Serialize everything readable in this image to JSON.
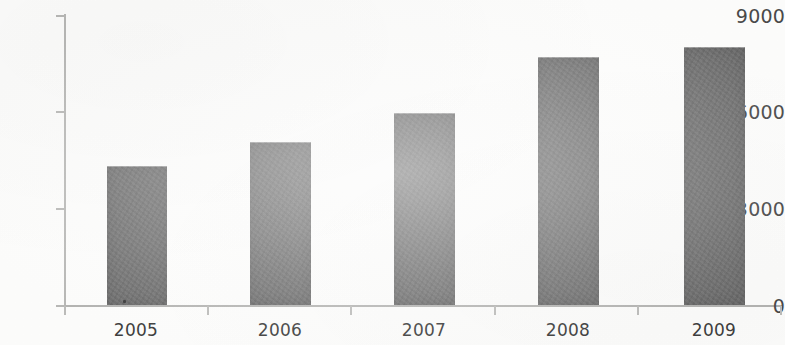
{
  "chart_data": {
    "type": "bar",
    "title": "",
    "subtitle": "",
    "xlabel": "",
    "ylabel": "",
    "categories": [
      "2005",
      "2006",
      "2007",
      "2008",
      "2009"
    ],
    "values": [
      4300,
      5050,
      5950,
      7700,
      8000
    ],
    "series": [
      {
        "name": "",
        "values": [
          4300,
          5050,
          5950,
          7700,
          8000
        ]
      }
    ],
    "ylim": [
      0,
      9000
    ],
    "y_ticks": [
      0,
      3000,
      6000,
      9000
    ],
    "y_tick_labels": [
      "0",
      "3000",
      "6000",
      "9000"
    ],
    "x_tick_labels": [
      "2005",
      "2006",
      "2007",
      "2008",
      "2009"
    ],
    "grid": false,
    "legend": false,
    "legend_position": "none",
    "annotations": []
  },
  "style": {
    "bar_color": "#6d6d6d",
    "axis_color": "#b9b9b7",
    "tick_label_color": "#4a4a4a",
    "background_color": "#fdfdfb"
  }
}
